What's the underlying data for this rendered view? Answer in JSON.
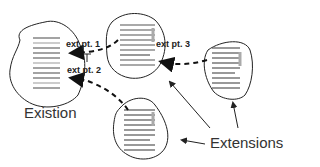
{
  "diagram": {
    "labels": {
      "existing": "Existion",
      "extensions": "Extensions",
      "ext_pt_1": "ext pt. 1",
      "ext_pt_2": "ext pt. 2",
      "ext_pt_3": "ext pt. 3"
    },
    "colors": {
      "outline": "#222222",
      "lines": "#555555",
      "highlight": "#aaaaaa"
    }
  }
}
